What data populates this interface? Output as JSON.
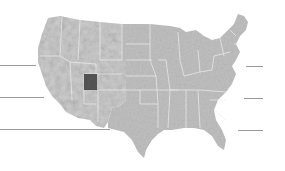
{
  "map": {
    "subject": "Contiguous United States relief map",
    "highlighted_region": "Utah",
    "colors": {
      "background": "#ffffff",
      "land_west": "#c9c9c9",
      "land_east": "#bdbdbd",
      "state_border": "#ececec",
      "highlight": "#555555",
      "leader_line": "#9a9a9a"
    }
  },
  "leader_lines": {
    "left": [
      {
        "y": 65,
        "x1": 0,
        "x2": 36
      },
      {
        "y": 97,
        "x1": 0,
        "x2": 44
      },
      {
        "y": 129,
        "x1": 0,
        "x2": 110
      }
    ],
    "right": [
      {
        "y": 66,
        "x1": 246,
        "x2": 263
      },
      {
        "y": 98,
        "x1": 244,
        "x2": 263
      },
      {
        "y": 130,
        "x1": 238,
        "x2": 263
      }
    ]
  }
}
